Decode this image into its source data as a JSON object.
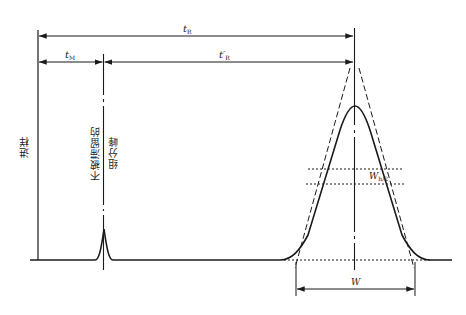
{
  "diagram": {
    "type": "chromatogram",
    "labels": {
      "retention_time": {
        "main": "t",
        "sub": "R"
      },
      "dead_time": {
        "main": "t",
        "sub": "M"
      },
      "adjusted_retention_time": {
        "main": "t′",
        "sub": "R"
      },
      "half_height_width": {
        "main": "W",
        "sub": "h/2"
      },
      "peak_width": {
        "main": "W"
      },
      "injection": "进样",
      "unretained_line1": "不被滞留的",
      "unretained_line2": "组分峰"
    },
    "colors": {
      "line": "#1a1a1a",
      "background": "#ffffff"
    }
  }
}
